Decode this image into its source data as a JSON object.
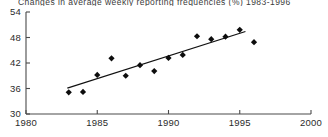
{
  "chart_data": {
    "type": "scatter",
    "title": "Changes in average weekly reporting frequencies (%) 1983-1996",
    "xlabel": "",
    "ylabel": "",
    "xlim": [
      1980,
      2000
    ],
    "ylim": [
      30,
      54
    ],
    "xticks": [
      1980,
      1985,
      1990,
      1995,
      2000
    ],
    "yticks": [
      30,
      36,
      42,
      48,
      54
    ],
    "xtick_labels": [
      "1980",
      "1985",
      "1990",
      "1995",
      "2000"
    ],
    "ytick_labels": [
      "30",
      "36",
      "42",
      "48",
      "54"
    ],
    "grid": false,
    "legend": false,
    "marker": "diamond",
    "marker_color": "#0d0d0d",
    "line_color": "#111111",
    "axis_color": "#4a4a4a",
    "x": [
      1983,
      1984,
      1985,
      1986,
      1987,
      1988,
      1989,
      1990,
      1991,
      1992,
      1993,
      1994,
      1995,
      1996
    ],
    "values": [
      35.1,
      35.2,
      39.2,
      43.1,
      39.0,
      41.5,
      40.1,
      43.2,
      43.9,
      48.3,
      47.6,
      48.2,
      49.8,
      46.9
    ],
    "series": [
      {
        "name": "Average weekly reporting frequency",
        "x": [
          1983,
          1984,
          1985,
          1986,
          1987,
          1988,
          1989,
          1990,
          1991,
          1992,
          1993,
          1994,
          1995,
          1996
        ],
        "values": [
          35.1,
          35.2,
          39.2,
          43.1,
          39.0,
          41.5,
          40.1,
          43.2,
          43.9,
          48.3,
          47.6,
          48.2,
          49.8,
          46.9
        ]
      }
    ],
    "trendline": {
      "type": "linear-fit",
      "x": [
        1982.9,
        1995.4
      ],
      "values": [
        36.1,
        49.4
      ]
    }
  }
}
